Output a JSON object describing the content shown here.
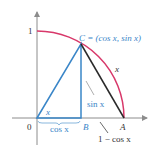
{
  "diagram": {
    "colors": {
      "axis": "#8c8c8c",
      "arc": "#d8386a",
      "triangle": "#3a86c8",
      "chord": "#2a2a2a",
      "label_blue": "#3a86c8",
      "label_dark": "#333333"
    },
    "labels": {
      "y_tick_one": "1",
      "origin": "0",
      "point_c": "C = (cos x, sin x)",
      "arc_length": "x",
      "angle": "x",
      "sin": "sin x",
      "cos": "cos x",
      "point_b": "B",
      "point_a": "A",
      "one_minus_cos": "1 − cos x"
    }
  }
}
